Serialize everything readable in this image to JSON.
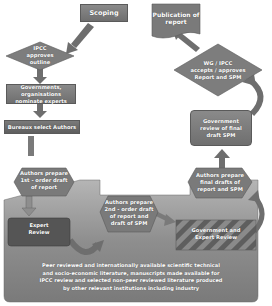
{
  "diagram": {
    "nodes": {
      "scoping": "Scoping",
      "publication": "Publication of report",
      "ipcc_approves": [
        "IPCC",
        "approves",
        "outline"
      ],
      "governments_nominate": [
        "Governments,",
        "organisations",
        "nominate experts"
      ],
      "bureaux_select": "Bureaux select Authors",
      "first_order": [
        "Authors prepare",
        "1st - order draft",
        "of report"
      ],
      "expert_review": [
        "Expert",
        "Review"
      ],
      "second_order": [
        "Authors prepare",
        "2nd - order draft",
        "of report and",
        "draft of SPM"
      ],
      "gov_expert_review": [
        "Government and",
        "Expert Review"
      ],
      "final_drafts": [
        "Authors prepare",
        "final drafts of",
        "report and SPM"
      ],
      "gov_review_final": [
        "Government",
        "review of final",
        "draft SPM"
      ],
      "wg_accepts": [
        "WG / IPCC",
        "accepts / approves",
        "Report and SPM"
      ],
      "literature": [
        "Peer reviewed and internationally available scientific technical",
        "and socio-economic literature, manuscripts made available for",
        "IPCC review and selected non-peer reviewed literature produced",
        "by other relevant institutions including industry"
      ]
    },
    "colors": {
      "box": "#7a7a7a",
      "arrow": "#6e6e6e",
      "band": "#9a9a9a",
      "text": "#ffffff"
    }
  }
}
